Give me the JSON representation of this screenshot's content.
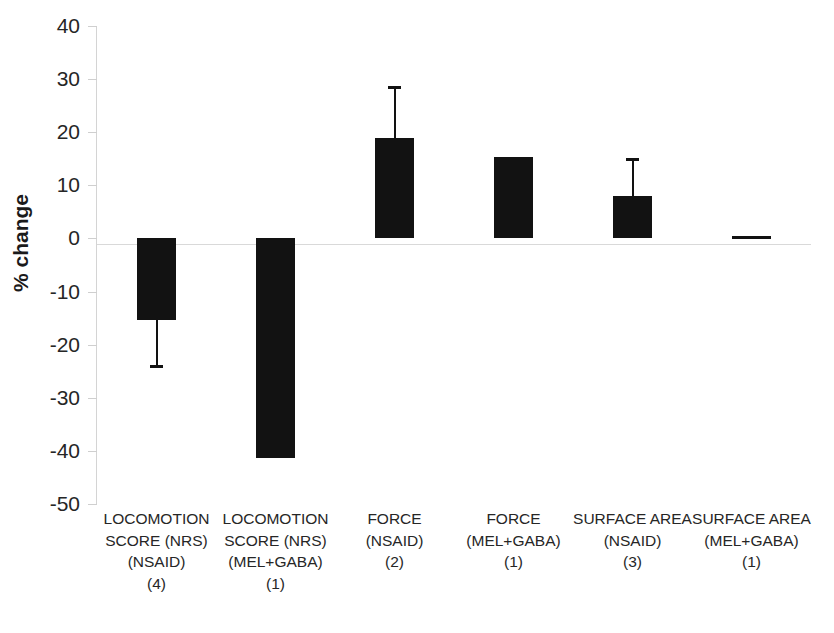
{
  "chart_data": {
    "type": "bar",
    "title": "",
    "xlabel": "",
    "ylabel": "% change",
    "ylim": [
      -50,
      40
    ],
    "ytick_step": 10,
    "grid": false,
    "legend": null,
    "bar_color": "#121212",
    "axis_color": "#d4d4d4",
    "zero_line": 0,
    "categories": [
      "LOCOMOTION SCORE (NRS) (NSAID) (4)",
      "LOCOMOTION SCORE (NRS) (MEL+GABA) (1)",
      "FORCE (NSAID) (2)",
      "FORCE (MEL+GABA) (1)",
      "SURFACE AREA (NSAID) (3)",
      "SURFACE AREA (MEL+GABA) (1)"
    ],
    "values": [
      -15.3,
      -41.3,
      19.0,
      15.3,
      8.0,
      0.5
    ],
    "errors": [
      8.7,
      null,
      9.5,
      null,
      7.0,
      null
    ],
    "ytick_labels": [
      "40",
      "30",
      "20",
      "10",
      "0",
      "-10",
      "-20",
      "-30",
      "-40",
      "-50"
    ],
    "ytick_values": [
      40,
      30,
      20,
      10,
      0,
      -10,
      -20,
      -30,
      -40,
      -50
    ],
    "category_label_lines": [
      [
        "LOCOMOTION",
        "SCORE (NRS)",
        "(NSAID)",
        "(4)"
      ],
      [
        "LOCOMOTION",
        "SCORE (NRS)",
        "(MEL+GABA)",
        "(1)"
      ],
      [
        "FORCE",
        "(NSAID)",
        "(2)"
      ],
      [
        "FORCE",
        "(MEL+GABA)",
        "(1)"
      ],
      [
        "SURFACE AREA",
        "(NSAID)",
        "(3)"
      ],
      [
        "SURFACE AREA",
        "(MEL+GABA)",
        "(1)"
      ]
    ]
  }
}
